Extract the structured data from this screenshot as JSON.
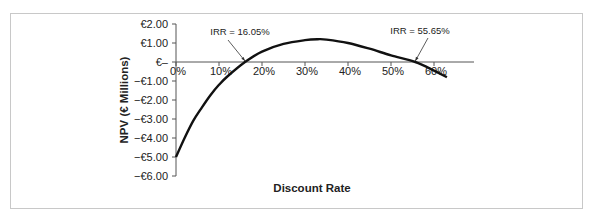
{
  "chart_data": {
    "type": "line",
    "title": "",
    "xlabel": "Discount Rate",
    "ylabel": "NPV (€ Millions)",
    "x_ticks": [
      "0%",
      "10%",
      "20%",
      "30%",
      "40%",
      "50%",
      "60%"
    ],
    "y_ticks": [
      "€2.00",
      "€1.00",
      "€–",
      "−€1.00",
      "−€2.00",
      "−€3.00",
      "−€4.00",
      "−€5.00",
      "−€6.00"
    ],
    "xlim": [
      0,
      0.65
    ],
    "ylim": [
      -6,
      2
    ],
    "grid": false,
    "legend": "none",
    "series": [
      {
        "name": "NPV",
        "x": [
          0,
          0.02,
          0.04,
          0.06,
          0.08,
          0.1,
          0.12,
          0.1605,
          0.2,
          0.25,
          0.3,
          0.33,
          0.35,
          0.4,
          0.45,
          0.5,
          0.5565,
          0.6,
          0.63
        ],
        "y": [
          -5.0,
          -4.0,
          -3.1,
          -2.4,
          -1.75,
          -1.2,
          -0.75,
          0.0,
          0.55,
          0.95,
          1.15,
          1.2,
          1.18,
          1.0,
          0.7,
          0.35,
          0.0,
          -0.45,
          -0.8
        ],
        "color": "#111111"
      }
    ],
    "annotations": [
      {
        "text": "IRR = 16.05%",
        "x": 0.1605,
        "y": 0
      },
      {
        "text": "IRR = 55.65%",
        "x": 0.5565,
        "y": 0
      }
    ]
  },
  "colors": {
    "line": "#111111",
    "axis": "#555555",
    "frame": "#c8c8c8"
  }
}
